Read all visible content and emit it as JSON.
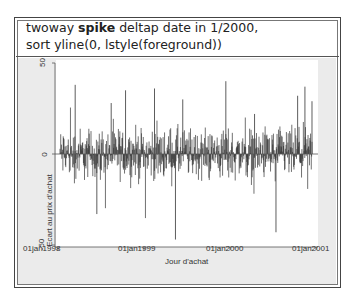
{
  "command": {
    "prefix": "twoway ",
    "keyword": "spike",
    "line1_rest": " deltap date in 1/2000,",
    "line2": "sort yline(0, lstyle(foreground))"
  },
  "chart_data": {
    "type": "spike",
    "title": "",
    "xlabel": "Jour d'achat",
    "ylabel": "Ecart au prix d'achat",
    "x_ticks": [
      "01jan1998",
      "01jan1999",
      "01jan2000",
      "01jan2001"
    ],
    "y_ticks": [
      "50",
      "0",
      "-50"
    ],
    "ylim": [
      -50,
      50
    ],
    "xlim": [
      "01jan1998",
      "01jan2001"
    ],
    "yline": 0,
    "n_obs": 2000,
    "notable_peaks": [
      {
        "x": "1998-03",
        "y": 38
      },
      {
        "x": "1998-06",
        "y": -33
      },
      {
        "x": "1998-08",
        "y": 28
      },
      {
        "x": "1998-10",
        "y": 35
      },
      {
        "x": "1999-02",
        "y": 36
      },
      {
        "x": "1999-05",
        "y": -47
      },
      {
        "x": "1999-06",
        "y": 30
      },
      {
        "x": "1999-12",
        "y": 40
      },
      {
        "x": "2000-04",
        "y": 22
      },
      {
        "x": "2000-07",
        "y": -43
      },
      {
        "x": "2000-10",
        "y": 32
      },
      {
        "x": "2000-11",
        "y": 37
      },
      {
        "x": "2000-12",
        "y": 29
      }
    ],
    "series_color": "#333333",
    "plot_bg": "#ffffff",
    "graph_bg": "#ebebeb"
  }
}
